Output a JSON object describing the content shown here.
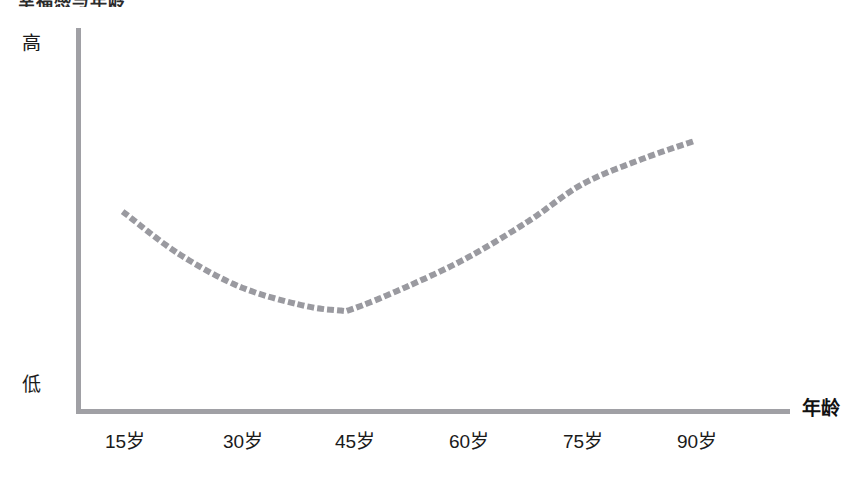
{
  "title_remnant": "幸福感与年龄",
  "axes": {
    "y_high_label": "高",
    "y_low_label": "低",
    "x_title": "年龄"
  },
  "colors": {
    "axis": "#a0a0a5",
    "line": "#9a9aa0",
    "text": "#1a1a1a"
  },
  "chart_data": {
    "type": "line",
    "title": "",
    "xlabel": "年龄",
    "ylabel": "",
    "ylim": [
      0,
      1
    ],
    "grid": false,
    "legend": "none",
    "line_style": "dotted",
    "y_axis_categories": [
      "低",
      "高"
    ],
    "tick_labels": [
      "15岁",
      "30岁",
      "45岁",
      "60岁",
      "75岁",
      "90岁"
    ],
    "x": [
      15,
      30,
      45,
      60,
      75,
      90
    ],
    "series": [
      {
        "name": "幸福感",
        "values": [
          0.54,
          0.34,
          0.28,
          0.42,
          0.62,
          0.74
        ]
      }
    ],
    "points": [
      {
        "x": 15,
        "y": 0.54
      },
      {
        "x": 22,
        "y": 0.43
      },
      {
        "x": 30,
        "y": 0.34
      },
      {
        "x": 38,
        "y": 0.29
      },
      {
        "x": 43,
        "y": 0.275
      },
      {
        "x": 45,
        "y": 0.28
      },
      {
        "x": 52,
        "y": 0.34
      },
      {
        "x": 60,
        "y": 0.42
      },
      {
        "x": 68,
        "y": 0.52
      },
      {
        "x": 75,
        "y": 0.62
      },
      {
        "x": 83,
        "y": 0.69
      },
      {
        "x": 90,
        "y": 0.74
      }
    ],
    "annotations": [
      {
        "text": "曲线最低点约在 43 岁附近"
      }
    ]
  }
}
